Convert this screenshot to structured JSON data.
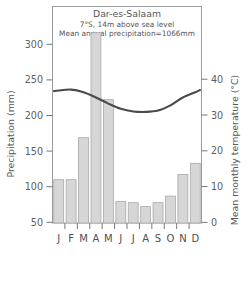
{
  "chart_data": {
    "type": "bar",
    "title": "Dar-es-Salaam",
    "subtitle_1": "7°S, 14m above sea level",
    "subtitle_2": "Mean annual precipitation=1066mm",
    "categories": [
      "J",
      "F",
      "M",
      "A",
      "M",
      "J",
      "J",
      "A",
      "S",
      "O",
      "N",
      "D"
    ],
    "xlabel": "",
    "ylabel": "Precipitation (mm)",
    "ylabel_right": "Mean monthly temperature (°C)",
    "ylim": [
      0,
      330
    ],
    "ylim_right": [
      -2.3,
      47.2
    ],
    "yticks": [
      50,
      100,
      150,
      200,
      250,
      300
    ],
    "yticks_right": [
      0,
      10,
      20,
      30,
      40
    ],
    "grid": false,
    "legend": "none",
    "series": [
      {
        "name": "Precipitation",
        "kind": "bar",
        "unit": "mm",
        "axis": "left",
        "color": "#d6d6d6",
        "values": [
          66,
          66,
          130,
          290,
          188,
          33,
          31,
          25,
          31,
          41,
          74,
          91
        ]
      },
      {
        "name": "Mean monthly temperature",
        "kind": "line",
        "unit": "°C",
        "axis": "right",
        "color": "#4a4a4c",
        "values": [
          28.0,
          28.2,
          27.6,
          26.4,
          25.0,
          23.8,
          23.2,
          23.1,
          23.4,
          24.6,
          26.4,
          27.6
        ]
      }
    ]
  },
  "axis_titles": {
    "left": "Precipitation (mm)",
    "right": "Mean monthly temperature (°C)"
  },
  "tick_labels": {
    "left": [
      "300",
      "250",
      "200",
      "150",
      "100",
      "50"
    ],
    "right": [
      "40",
      "30",
      "20",
      "10",
      "0"
    ],
    "bottom": [
      "J",
      "F",
      "M",
      "A",
      "M",
      "J",
      "J",
      "A",
      "S",
      "O",
      "N",
      "D"
    ]
  },
  "header": {
    "line1": "Dar-es-Salaam",
    "line2": "7°S, 14m above sea level",
    "line3": "Mean annual precipitation=1066mm"
  }
}
